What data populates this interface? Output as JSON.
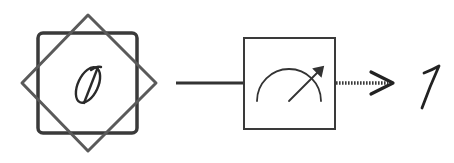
{
  "diagram": {
    "type": "quantum-measurement",
    "input_state": {
      "symbol": "0",
      "icon": "qubit-star-frame-icon",
      "frame": {
        "square_color": "#3a3a3a",
        "diamond_color": "#5a5a5a"
      }
    },
    "quantum_wire": {
      "style": "solid",
      "color": "#3a3a3a"
    },
    "measurement_gate": {
      "icon": "meter-gauge-icon",
      "color": "#3a3a3a"
    },
    "classical_wire": {
      "style": "dotted",
      "color": "#3a3a3a"
    },
    "output": {
      "symbol": "1",
      "icon": "arrow-right-icon"
    }
  }
}
